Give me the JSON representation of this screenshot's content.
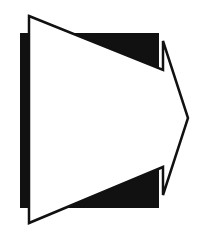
{
  "graphic": {
    "type": "arrow-icon",
    "description": "white right-pointing block arrow with black outline over a black rectangle",
    "colors": {
      "background": "#ffffff",
      "shadow_block": "#111111",
      "arrow_fill": "#ffffff",
      "arrow_stroke": "#111111"
    },
    "icons": [
      "right-arrow-icon",
      "shadow-block"
    ]
  }
}
